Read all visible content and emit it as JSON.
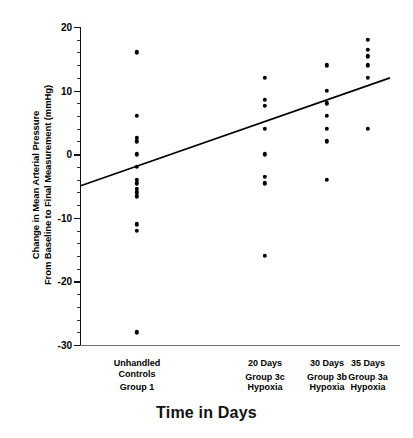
{
  "chart_data": {
    "type": "scatter",
    "title": "",
    "xlabel": "Time in Days",
    "ylabel_line1": "Change in Mean Arterial Pressure",
    "ylabel_line2": "From Baseline to Final Measurement (mmHg)",
    "ylim": [
      -30,
      20
    ],
    "yticks": [
      20,
      10,
      0,
      -10,
      -20,
      -30
    ],
    "yticklabels": [
      "20",
      "10",
      "0",
      "-10",
      "-20",
      "-30"
    ],
    "yminor_step": 2,
    "grid": false,
    "legend": "none",
    "marker_color": "#000000",
    "line_color": "#000000",
    "axis_color": "#111111",
    "categories": [
      {
        "id": "group1",
        "x_px": 137,
        "label_lines": [
          "Unhandled",
          "Controls",
          "",
          "Group 1"
        ],
        "line1": "Unhandled",
        "line2": "Controls",
        "line3": "Group 1",
        "values": [
          16,
          6,
          2,
          2.6,
          0,
          -2,
          -4,
          -4.6,
          -5.4,
          -6,
          -6.6,
          -11,
          -12,
          -28
        ]
      },
      {
        "id": "group3c",
        "x_px": 265,
        "label_lines": [
          "20 Days",
          "",
          "Group 3c",
          "Hypoxia"
        ],
        "line1": "20 Days",
        "line2": "Group 3c",
        "line3": "Hypoxia",
        "values": [
          12,
          8.6,
          7.6,
          4,
          0,
          -3.6,
          -4.6,
          -16
        ]
      },
      {
        "id": "group3b",
        "x_px": 327,
        "label_lines": [
          "30 Days",
          "",
          "Group 3b",
          "Hypoxia"
        ],
        "line1": "30 Days",
        "line2": "Group 3b",
        "line3": "Hypoxia",
        "values": [
          14,
          10,
          8,
          6,
          4,
          2,
          -4
        ]
      },
      {
        "id": "group3a",
        "x_px": 368,
        "label_lines": [
          "35 Days",
          "",
          "Group 3a",
          "Hypoxia"
        ],
        "line1": "35 Days",
        "line2": "Group 3a",
        "line3": "Hypoxia",
        "values": [
          18,
          16.4,
          15.4,
          14,
          12,
          4
        ]
      }
    ],
    "regression_line": {
      "x_start_px": 80,
      "x_end_px": 390,
      "y_start_value": -5,
      "y_end_value": 12
    }
  }
}
